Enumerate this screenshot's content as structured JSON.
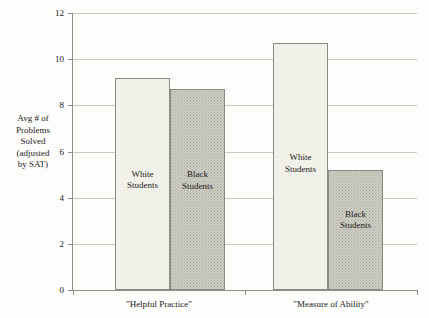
{
  "chart_data": {
    "type": "bar",
    "title": "",
    "subtitle": "",
    "xlabel": "",
    "ylabel": "Avg # of Problems Solved (adjusted by SAT)",
    "ylabel_lines": [
      "Avg # of",
      "Problems",
      "Solved",
      "(adjusted",
      "by SAT)"
    ],
    "categories": [
      "\"Helpful Practice\"",
      "\"Measure of Ability\""
    ],
    "series": [
      {
        "name": "White Students",
        "values": [
          9.2,
          10.7
        ]
      },
      {
        "name": "Black Students",
        "values": [
          8.7,
          5.2
        ]
      }
    ],
    "bar_labels": [
      [
        "White Students",
        "Black Students"
      ],
      [
        "White Students",
        "Black Students"
      ]
    ],
    "ylim": [
      0,
      12
    ],
    "yticks": [
      0,
      2,
      4,
      6,
      8,
      10,
      12
    ],
    "ytick_labels": [
      "0",
      "2",
      "4",
      "6",
      "8",
      "10",
      "12"
    ],
    "grid": true,
    "legend": "none",
    "colors": {
      "white_bar_fill": "#f2f1e9",
      "black_bar_fill": "#cfcec4",
      "bar_border": "#8a8a82",
      "gridline": "#c9c9c2",
      "axis": "#8f8f88",
      "text": "#1a1a1a",
      "background": "#fdfdfb"
    }
  }
}
